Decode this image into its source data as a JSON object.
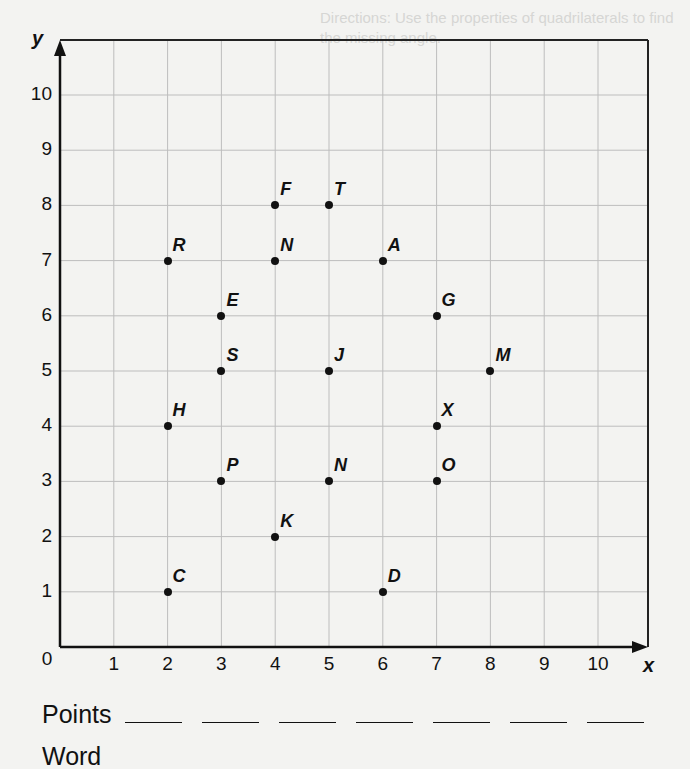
{
  "background_text": {
    "directions_line1": "Directions: Use the properties of quadrilaterals to find",
    "directions_line2": "the missing angle."
  },
  "chart_data": {
    "type": "scatter",
    "title": "",
    "xlabel": "x",
    "ylabel": "y",
    "xlim": [
      0,
      10
    ],
    "ylim": [
      0,
      10
    ],
    "grid": true,
    "origin_label": "0",
    "x_ticks": [
      "1",
      "2",
      "3",
      "4",
      "5",
      "6",
      "7",
      "8",
      "9",
      "10"
    ],
    "y_ticks": [
      "1",
      "2",
      "3",
      "4",
      "5",
      "6",
      "7",
      "8",
      "9",
      "10"
    ],
    "points": [
      {
        "label": "F",
        "x": 4,
        "y": 8
      },
      {
        "label": "T",
        "x": 5,
        "y": 8
      },
      {
        "label": "R",
        "x": 2,
        "y": 7
      },
      {
        "label": "N",
        "x": 4,
        "y": 7
      },
      {
        "label": "A",
        "x": 6,
        "y": 7
      },
      {
        "label": "E",
        "x": 3,
        "y": 6
      },
      {
        "label": "G",
        "x": 7,
        "y": 6
      },
      {
        "label": "S",
        "x": 3,
        "y": 5
      },
      {
        "label": "J",
        "x": 5,
        "y": 5
      },
      {
        "label": "M",
        "x": 8,
        "y": 5
      },
      {
        "label": "H",
        "x": 2,
        "y": 4
      },
      {
        "label": "X",
        "x": 7,
        "y": 4
      },
      {
        "label": "P",
        "x": 3,
        "y": 3
      },
      {
        "label": "N",
        "x": 5,
        "y": 3
      },
      {
        "label": "O",
        "x": 7,
        "y": 3
      },
      {
        "label": "K",
        "x": 4,
        "y": 2
      },
      {
        "label": "C",
        "x": 2,
        "y": 1
      },
      {
        "label": "D",
        "x": 6,
        "y": 1
      }
    ]
  },
  "answers": {
    "points_label": "Points",
    "blank_count": 7,
    "word_label": "Word"
  }
}
